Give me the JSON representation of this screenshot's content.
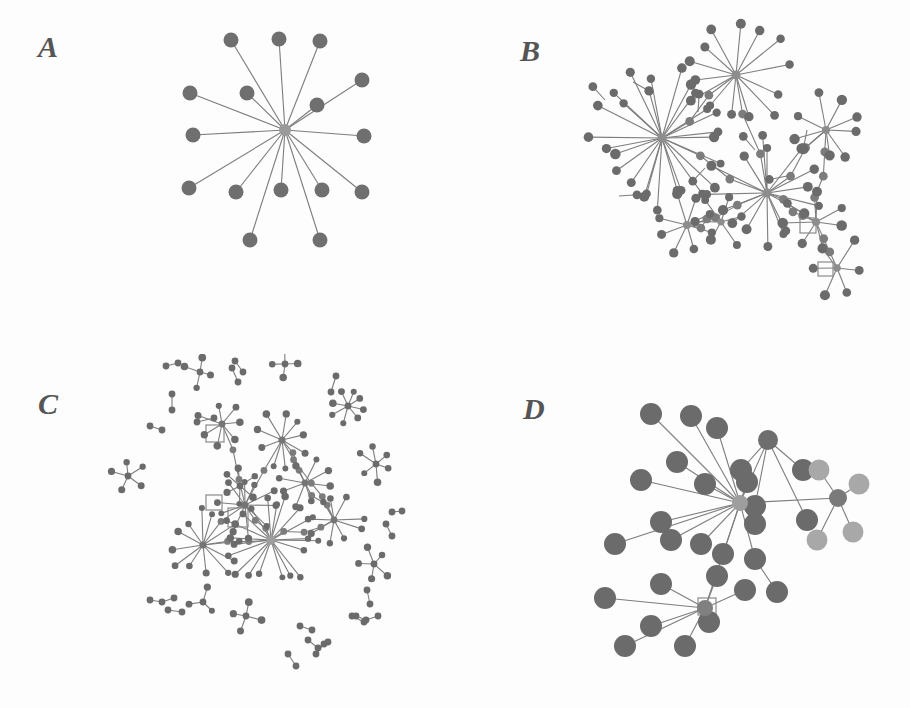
{
  "figure": {
    "type": "multi-panel-network-diagram",
    "panel_count": 4,
    "background_color": "#fdfdfd",
    "width": 910,
    "height": 708
  },
  "palette": {
    "node_dark": "#6b6b6b",
    "node_mid": "#7c7c7c",
    "node_light": "#a8a8a8",
    "hub_light": "#a0a0a0",
    "edge": "#7d7d7d",
    "label": "#555555",
    "square_outline": "#8a8a8a"
  },
  "panels": [
    {
      "id": "a",
      "label": "A",
      "label_x": 48,
      "label_y": 48,
      "description": "single star component, one central hub with fifteen pendant nodes",
      "node_radius": 7.5,
      "hub_radius": 6,
      "components": 1,
      "hubs": [
        {
          "x": 285,
          "y": 130,
          "r": 6,
          "fill": "#9a9a9a"
        }
      ],
      "nodes": [
        {
          "x": 231,
          "y": 40,
          "r": 7.5,
          "fill": "#6f6f6f"
        },
        {
          "x": 279,
          "y": 39,
          "r": 7.5,
          "fill": "#6f6f6f"
        },
        {
          "x": 320,
          "y": 41,
          "r": 7.5,
          "fill": "#6f6f6f"
        },
        {
          "x": 362,
          "y": 80,
          "r": 7.5,
          "fill": "#6f6f6f"
        },
        {
          "x": 190,
          "y": 93,
          "r": 7.5,
          "fill": "#6f6f6f"
        },
        {
          "x": 247,
          "y": 93,
          "r": 7.5,
          "fill": "#6f6f6f"
        },
        {
          "x": 317,
          "y": 105,
          "r": 7.5,
          "fill": "#6f6f6f"
        },
        {
          "x": 193,
          "y": 135,
          "r": 7.5,
          "fill": "#6f6f6f"
        },
        {
          "x": 364,
          "y": 136,
          "r": 7.5,
          "fill": "#6f6f6f"
        },
        {
          "x": 189,
          "y": 188,
          "r": 7.5,
          "fill": "#6f6f6f"
        },
        {
          "x": 236,
          "y": 192,
          "r": 7.5,
          "fill": "#6f6f6f"
        },
        {
          "x": 281,
          "y": 190,
          "r": 7.5,
          "fill": "#6f6f6f"
        },
        {
          "x": 322,
          "y": 190,
          "r": 7.5,
          "fill": "#6f6f6f"
        },
        {
          "x": 362,
          "y": 192,
          "r": 7.5,
          "fill": "#6f6f6f"
        },
        {
          "x": 250,
          "y": 240,
          "r": 7.5,
          "fill": "#6f6f6f"
        },
        {
          "x": 320,
          "y": 240,
          "r": 7.5,
          "fill": "#6f6f6f"
        }
      ],
      "edges": [
        [
          285,
          130,
          231,
          40
        ],
        [
          285,
          130,
          279,
          39
        ],
        [
          285,
          130,
          320,
          41
        ],
        [
          285,
          130,
          362,
          80
        ],
        [
          285,
          130,
          190,
          93
        ],
        [
          285,
          130,
          247,
          93
        ],
        [
          285,
          130,
          317,
          105
        ],
        [
          285,
          130,
          193,
          135
        ],
        [
          285,
          130,
          364,
          136
        ],
        [
          285,
          130,
          189,
          188
        ],
        [
          285,
          130,
          236,
          192
        ],
        [
          285,
          130,
          281,
          190
        ],
        [
          285,
          130,
          322,
          190
        ],
        [
          285,
          130,
          362,
          192
        ],
        [
          285,
          130,
          250,
          240
        ],
        [
          285,
          130,
          320,
          240
        ]
      ],
      "squares": []
    },
    {
      "id": "b",
      "label": "B",
      "label_x": 75,
      "label_y": 52,
      "description": "one large connected component, several high degree hubs joined by bridging paths, two open square nodes",
      "node_radius": 4.6,
      "components": 1,
      "hubs": [
        {
          "x": 207,
          "y": 138,
          "r": 4.5,
          "fill": "#8d8d8d"
        },
        {
          "x": 281,
          "y": 75,
          "r": 4.5,
          "fill": "#8d8d8d"
        },
        {
          "x": 371,
          "y": 130,
          "r": 4.0,
          "fill": "#8d8d8d"
        },
        {
          "x": 312,
          "y": 193,
          "r": 4.5,
          "fill": "#8d8d8d"
        },
        {
          "x": 232,
          "y": 225,
          "r": 4.0,
          "fill": "#8d8d8d"
        },
        {
          "x": 266,
          "y": 222,
          "r": 3.6,
          "fill": "#8d8d8d"
        },
        {
          "x": 361,
          "y": 222,
          "r": 4.0,
          "fill": "#8d8d8d"
        },
        {
          "x": 382,
          "y": 268,
          "r": 3.8,
          "fill": "#8d8d8d"
        }
      ],
      "squares": [
        {
          "x": 345,
          "y": 218,
          "w": 16,
          "h": 15
        },
        {
          "x": 363,
          "y": 262,
          "w": 15,
          "h": 14
        }
      ],
      "leaf_counts": {
        "hub1": 26,
        "hub2": 14,
        "hub3": 9,
        "hub4": 16,
        "hub5": 8,
        "hub6": 6,
        "hub7": 7,
        "hub8": 6
      }
    },
    {
      "id": "c",
      "label": "C",
      "label_x": 48,
      "label_y": 405,
      "description": "dense central cluster of interlinked stars surrounded by many small isolated components, dyads triads and small stars, two open square nodes near centre",
      "node_radius": 3.4,
      "components": 24,
      "hubs": [
        {
          "x": 271,
          "y": 540,
          "r": 4.8,
          "fill": "#9d9d9d"
        },
        {
          "x": 203,
          "y": 545,
          "r": 3.6,
          "fill": "#757575"
        },
        {
          "x": 245,
          "y": 505,
          "r": 3.6,
          "fill": "#757575"
        },
        {
          "x": 282,
          "y": 440,
          "r": 3.6,
          "fill": "#757575"
        },
        {
          "x": 305,
          "y": 483,
          "r": 3.4,
          "fill": "#757575"
        },
        {
          "x": 222,
          "y": 424,
          "r": 3.4,
          "fill": "#757575"
        },
        {
          "x": 334,
          "y": 520,
          "r": 3.4,
          "fill": "#757575"
        }
      ],
      "squares": [
        {
          "x": 206,
          "y": 495,
          "w": 16,
          "h": 15
        },
        {
          "x": 228,
          "y": 508,
          "w": 20,
          "h": 19
        },
        {
          "x": 206,
          "y": 425,
          "w": 18,
          "h": 17
        }
      ],
      "isolated_component_types": [
        "dyad",
        "triad",
        "four-star",
        "six-star",
        "eight-star",
        "path-of-three"
      ]
    },
    {
      "id": "d",
      "label": "D",
      "label_x": 525,
      "label_y": 410,
      "description": "two large stars sharing the central hub plus a small satellite star on the right with lighter nodes, one faint open square node near the lower hub",
      "node_radius": 11,
      "components": 1,
      "hubs": [
        {
          "x": 740,
          "y": 503,
          "r": 8,
          "fill": "#9e9e9e"
        },
        {
          "x": 705,
          "y": 608,
          "r": 8,
          "fill": "#808080"
        },
        {
          "x": 838,
          "y": 498,
          "r": 9,
          "fill": "#7a7a7a"
        },
        {
          "x": 768,
          "y": 440,
          "r": 10,
          "fill": "#6e6e6e"
        }
      ],
      "squares": [
        {
          "x": 700,
          "y": 600,
          "w": 18,
          "h": 17
        }
      ],
      "leaf_counts": {
        "main_hub": 14,
        "lower_hub": 8,
        "right_hub": 4,
        "upper_hub": 4
      }
    }
  ]
}
